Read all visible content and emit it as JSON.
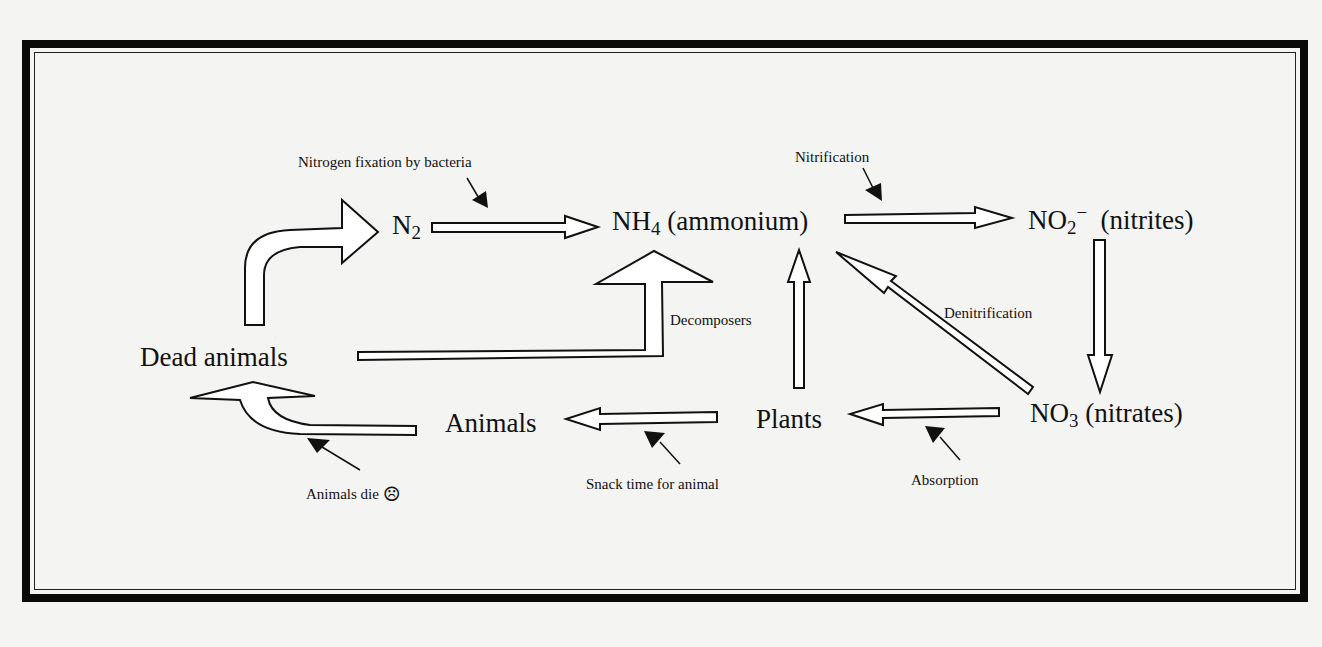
{
  "diagram": {
    "nodes": {
      "n2": {
        "base": "N",
        "sub": "2"
      },
      "nh4": {
        "base": "NH",
        "sub": "4",
        "suffix": " (ammonium)"
      },
      "no2": {
        "base": "NO",
        "sub": "2",
        "sup": "−",
        "suffix": "  (nitrites)"
      },
      "no3": {
        "base": "NO",
        "sub": "3",
        "suffix": " (nitrates)"
      },
      "plants": "Plants",
      "animals": "Animals",
      "dead_animals": "Dead animals"
    },
    "labels": {
      "nitrogen_fixation": "Nitrogen fixation by bacteria",
      "nitrification": "Nitrification",
      "decomposers": "Decomposers",
      "denitrification": "Denitrification",
      "absorption": "Absorption",
      "snack_time": "Snack time for animal",
      "animals_die": "Animals die",
      "sad_face": "☹"
    },
    "edges": [
      {
        "from": "Dead animals",
        "to": "N2",
        "style": "curved-outline-arrow"
      },
      {
        "from": "N2",
        "to": "NH4 (ammonium)",
        "label": "Nitrogen fixation by bacteria"
      },
      {
        "from": "NH4 (ammonium)",
        "to": "NO2- (nitrites)",
        "label": "Nitrification"
      },
      {
        "from": "NO2- (nitrites)",
        "to": "NO3 (nitrates)"
      },
      {
        "from": "NO3 (nitrates)",
        "to": "NH4 (ammonium)",
        "label": "Denitrification"
      },
      {
        "from": "NO3 (nitrates)",
        "to": "Plants",
        "label": "Absorption"
      },
      {
        "from": "Plants",
        "to": "NH4 (ammonium)"
      },
      {
        "from": "Plants",
        "to": "Animals",
        "label": "Snack time for animal"
      },
      {
        "from": "Animals",
        "to": "Dead animals",
        "label": "Animals die"
      },
      {
        "from": "Dead animals",
        "to": "NH4 (ammonium)",
        "label": "Decomposers"
      }
    ],
    "colors": {
      "ink": "#111111",
      "paper": "#f4f4f2",
      "frame": "#0a0a0a"
    }
  }
}
